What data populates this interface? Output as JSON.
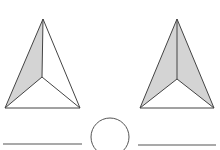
{
  "figure": {
    "stroke_color": "#444444",
    "shade_color": "#d4d4d4",
    "background": "#ffffff",
    "left_pyramid": {
      "apex": [
        43,
        19
      ],
      "base_left": [
        5,
        108
      ],
      "base_right": [
        80,
        108
      ],
      "inner": [
        42,
        77
      ],
      "shaded_faces": [
        "left"
      ]
    },
    "right_pyramid": {
      "apex": [
        177,
        19
      ],
      "base_left": [
        140,
        108
      ],
      "base_right": [
        214,
        108
      ],
      "inner": [
        177,
        79
      ],
      "shaded_faces": [
        "left",
        "right"
      ]
    },
    "answer_blank_left": {
      "x1": 3,
      "x2": 82,
      "y": 144
    },
    "answer_blank_right": {
      "x1": 138,
      "x2": 216,
      "y": 145
    },
    "comparison_circle": {
      "cx": 110,
      "cy": 137,
      "r": 19
    }
  }
}
